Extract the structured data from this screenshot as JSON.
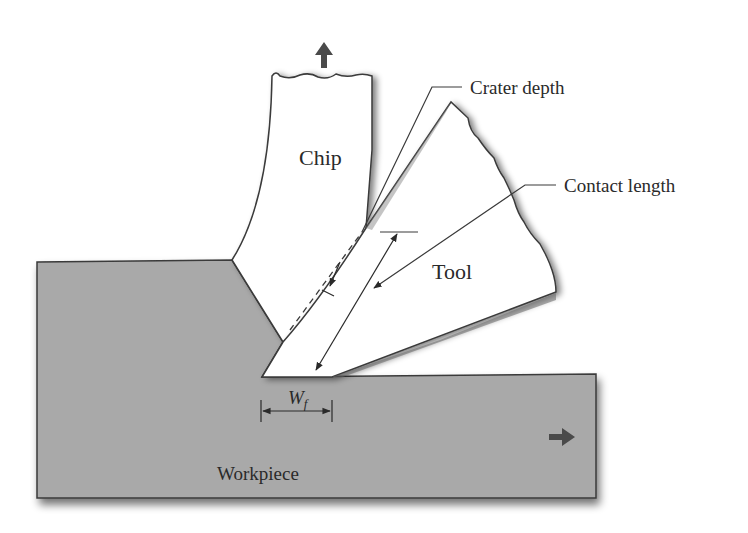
{
  "diagram": {
    "labels": {
      "chip": "Chip",
      "tool": "Tool",
      "workpiece": "Workpiece",
      "crater_depth": "Crater depth",
      "contact_length": "Contact length",
      "wear_land_symbol": "W",
      "wear_land_subscript": "f"
    },
    "colors": {
      "workpiece_fill": "#a9a9a9",
      "outline": "#3a3a3a",
      "background": "#ffffff",
      "arrow": "#4a4a4a"
    },
    "motion": {
      "chip_direction": "up",
      "workpiece_direction": "right"
    }
  }
}
